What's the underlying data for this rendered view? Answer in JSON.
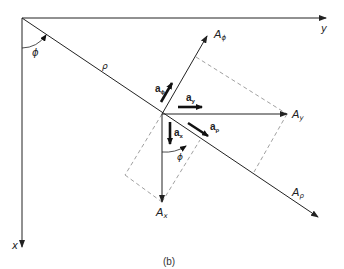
{
  "diagram": {
    "caption": "(b)",
    "axes": {
      "x_label": "x",
      "y_label": "y"
    },
    "angle_label": "ϕ",
    "radius_label": "ρ",
    "vectors": {
      "A_phi": {
        "base": "A",
        "sub": "ϕ"
      },
      "A_y": {
        "base": "A",
        "sub": "y"
      },
      "A_x": {
        "base": "A",
        "sub": "x"
      },
      "A_rho": {
        "base": "A",
        "sub": "ρ"
      }
    },
    "unit_vectors": {
      "a_phi": {
        "base": "a",
        "sub": "ϕ"
      },
      "a_y": {
        "base": "a",
        "sub": "y"
      },
      "a_x": {
        "base": "a",
        "sub": "x"
      },
      "a_rho": {
        "base": "a",
        "sub": "ρ"
      }
    },
    "colors": {
      "line": "#222222",
      "dashed": "#888888"
    }
  }
}
